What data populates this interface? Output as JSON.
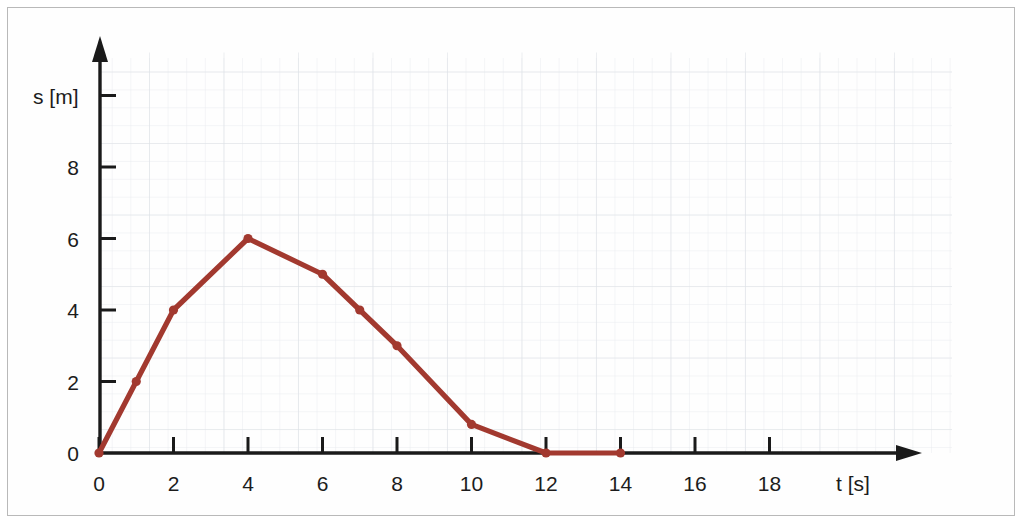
{
  "chart_data": {
    "type": "line",
    "title": "",
    "subtitle": "",
    "xlabel": "t [s]",
    "ylabel": "s  [m]",
    "xlim": [
      0,
      20
    ],
    "ylim": [
      0,
      9.6
    ],
    "grid": true,
    "legend": "none",
    "x_ticks": [
      0,
      2,
      4,
      6,
      8,
      10,
      12,
      14,
      16,
      18
    ],
    "x_tick_labels": [
      "0",
      "2",
      "4",
      "6",
      "8",
      "10",
      "12",
      "14",
      "16",
      "18"
    ],
    "y_ticks": [
      0,
      2,
      4,
      6,
      8
    ],
    "y_tick_labels": [
      "0",
      "2",
      "4",
      "6",
      "8"
    ],
    "series": [
      {
        "name": "s(t)",
        "color": "#a2392f",
        "marker": "circle",
        "x": [
          0,
          1,
          2,
          4,
          6,
          7,
          8,
          10,
          12,
          14
        ],
        "y": [
          0,
          2,
          4,
          6,
          5,
          4,
          3,
          0.8,
          0,
          0
        ]
      }
    ],
    "points": [
      {
        "t": 0,
        "s": 0
      },
      {
        "t": 1,
        "s": 2
      },
      {
        "t": 2,
        "s": 4
      },
      {
        "t": 4,
        "s": 6
      },
      {
        "t": 6,
        "s": 5
      },
      {
        "t": 7,
        "s": 4
      },
      {
        "t": 8,
        "s": 3
      },
      {
        "t": 10,
        "s": 0.8
      },
      {
        "t": 12,
        "s": 0
      },
      {
        "t": 14,
        "s": 0
      }
    ],
    "annotations": []
  },
  "colors": {
    "curve": "#a2392f",
    "axis": "#1a1a1a",
    "grid_minor": "#e9ecef",
    "grid_major": "#dfe3e8",
    "page_border": "#b9b9b9",
    "background": "#ffffff"
  }
}
